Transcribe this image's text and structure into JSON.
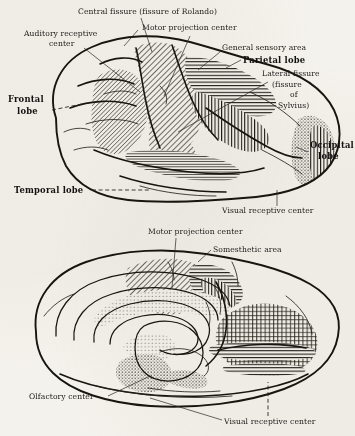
{
  "figure": {
    "background_color": "#f4f2ec",
    "ink_color": "#17150f"
  },
  "upper_figure": {
    "name": "lateral-view-of-cerebral-hemisphere",
    "labels": [
      {
        "id": "central-fissure",
        "text": "Central fissure (fissure of Rolando)",
        "x": 78,
        "y": 14,
        "anchor": "start",
        "style": "plain"
      },
      {
        "id": "motor-projection",
        "text": "Motor projection center",
        "x": 142,
        "y": 30,
        "anchor": "start",
        "style": "plain"
      },
      {
        "id": "auditory-receptive-1",
        "text": "Auditory receptive",
        "x": 24,
        "y": 36,
        "anchor": "start",
        "style": "plain"
      },
      {
        "id": "auditory-receptive-2",
        "text": "center",
        "x": 49,
        "y": 46,
        "anchor": "start",
        "style": "plain"
      },
      {
        "id": "general-sensory-area",
        "text": "General sensory area",
        "x": 222,
        "y": 50,
        "anchor": "start",
        "style": "plain"
      },
      {
        "id": "parietal-lobe",
        "text": "Parietal lobe",
        "x": 243,
        "y": 63,
        "anchor": "start",
        "style": "bold"
      },
      {
        "id": "lateral-fissure",
        "text": "Lateral fissure",
        "x": 262,
        "y": 76,
        "anchor": "start",
        "style": "plain"
      },
      {
        "id": "fissure-of-1",
        "text": "(fissure",
        "x": 272,
        "y": 87,
        "anchor": "start",
        "style": "plain"
      },
      {
        "id": "fissure-of-2",
        "text": "of",
        "x": 290,
        "y": 97,
        "anchor": "start",
        "style": "plain"
      },
      {
        "id": "fissure-of-3",
        "text": "Sylvius)",
        "x": 278,
        "y": 108,
        "anchor": "start",
        "style": "plain"
      },
      {
        "id": "frontal-lobe-1",
        "text": "Frontal",
        "x": 8,
        "y": 102,
        "anchor": "start",
        "style": "bold"
      },
      {
        "id": "frontal-lobe-2",
        "text": "lobe",
        "x": 17,
        "y": 114,
        "anchor": "start",
        "style": "bold"
      },
      {
        "id": "occipital-lobe-1",
        "text": "Occipital",
        "x": 310,
        "y": 148,
        "anchor": "start",
        "style": "bold"
      },
      {
        "id": "occipital-lobe-2",
        "text": "lobe",
        "x": 318,
        "y": 159,
        "anchor": "start",
        "style": "bold"
      },
      {
        "id": "temporal-lobe",
        "text": "Temporal lobe",
        "x": 14,
        "y": 193,
        "anchor": "start",
        "style": "bold"
      },
      {
        "id": "visual-receptive-center",
        "text": "Visual receptive center",
        "x": 222,
        "y": 213,
        "anchor": "start",
        "style": "plain"
      }
    ],
    "regions": [
      {
        "id": "motor-projection-area",
        "pattern": "diagonal-hatch"
      },
      {
        "id": "general-sensory-area",
        "pattern": "horizontal-hatch"
      },
      {
        "id": "parietal-vertical-area",
        "pattern": "vertical-hatch"
      },
      {
        "id": "auditory-receptive-area",
        "pattern": "diagonal-hatch"
      },
      {
        "id": "temporal-hatch-area",
        "pattern": "fine-horizontal-hatch"
      },
      {
        "id": "occipital-visual-area",
        "pattern": "stipple"
      }
    ]
  },
  "lower_figure": {
    "name": "medial-view-of-cerebral-hemisphere",
    "labels": [
      {
        "id": "motor-projection-center",
        "text": "Motor projection center",
        "x": 148,
        "y": 234,
        "anchor": "start",
        "style": "plain"
      },
      {
        "id": "somesthetic-area",
        "text": "Somesthetic area",
        "x": 213,
        "y": 252,
        "anchor": "start",
        "style": "plain"
      },
      {
        "id": "olfactory-center",
        "text": "Olfactory center",
        "x": 29,
        "y": 399,
        "anchor": "start",
        "style": "plain"
      },
      {
        "id": "visual-receptive-center",
        "text": "Visual receptive center",
        "x": 224,
        "y": 424,
        "anchor": "start",
        "style": "plain"
      }
    ],
    "regions": [
      {
        "id": "motor-projection-area",
        "pattern": "diagonal-hatch"
      },
      {
        "id": "somesthetic-area",
        "pattern": "horizontal-hatch"
      },
      {
        "id": "corpus-callosum-border",
        "pattern": "stipple"
      },
      {
        "id": "olfactory-center-area",
        "pattern": "stipple"
      },
      {
        "id": "visual-receptive-area",
        "pattern": "mixed-hatch"
      }
    ]
  }
}
